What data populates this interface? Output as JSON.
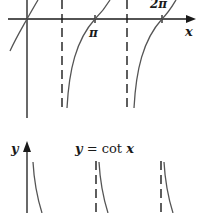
{
  "top_graph": {
    "function": "y = tan x",
    "x_axis_label": "x",
    "tick_labels": [
      "π",
      "2π"
    ],
    "asymptotes": [
      "π/2",
      "3π/2"
    ]
  },
  "bottom_graph": {
    "title": "y = cot x",
    "title_parts": {
      "lhs": "y",
      "eq": " = cot ",
      "var": "x"
    },
    "y_axis_label": "y"
  },
  "colors": {
    "ink": "#1a1a1a",
    "background": "#ffffff",
    "curve": "#555555"
  }
}
